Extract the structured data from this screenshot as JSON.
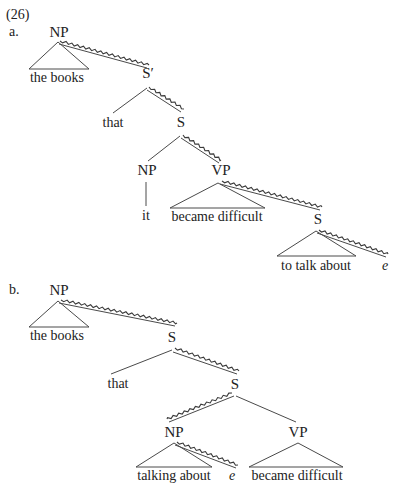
{
  "example_number": "(26)",
  "trees": [
    {
      "label": "a.",
      "nodes": {
        "root": "NP",
        "root_leaf": "the books",
        "sbar": "S′",
        "comp": "that",
        "s1": "S",
        "np": "NP",
        "np_leaf": "it",
        "vp": "VP",
        "vp_leaf": "became difficult",
        "s2": "S",
        "s2_leaf": "to talk about",
        "gap": "e"
      }
    },
    {
      "label": "b.",
      "nodes": {
        "root": "NP",
        "root_leaf": "the books",
        "s0": "S",
        "comp": "that",
        "s1": "S",
        "np": "NP",
        "np_leaf": "talking about",
        "gap": "e",
        "vp": "VP",
        "vp_leaf": "became difficult"
      }
    }
  ],
  "colors": {
    "ink": "#222222",
    "line": "#4a4a4a",
    "background": "#ffffff"
  }
}
